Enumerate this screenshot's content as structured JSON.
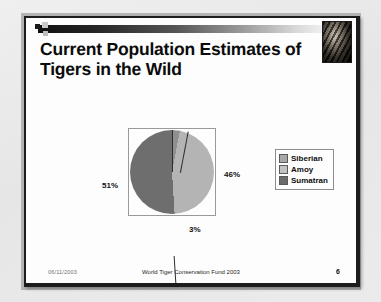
{
  "slide": {
    "title": "Current Population Estimates of Tigers in the Wild",
    "header_icon": "tiger-photo",
    "footer": {
      "date": "06/11/2003",
      "center": "World Tiger Conservation Fund 2003",
      "page_number": "6"
    }
  },
  "chart_data": {
    "type": "pie",
    "title": "",
    "categories": [
      "Siberian",
      "Amoy",
      "Sumatran"
    ],
    "values": [
      3,
      46,
      51
    ],
    "value_labels": [
      "3%",
      "46%",
      "51%"
    ],
    "colors": [
      "#8f8f8f",
      "#b4b4b4",
      "#6e6e6e"
    ],
    "legend_position": "right",
    "grid": false,
    "labels": {
      "left": "51%",
      "right": "46%",
      "bottom": "3%"
    }
  },
  "legend": {
    "items": [
      {
        "label": "Siberian",
        "color": "#a8a8a8"
      },
      {
        "label": "Amoy",
        "color": "#c2c2c2"
      },
      {
        "label": "Sumatran",
        "color": "#6b6b6b"
      }
    ]
  },
  "colors": {
    "slide_background": "#fdfdfd",
    "frame": "#1c1c1c",
    "page_background": "#e8e8e8",
    "title_text": "#0b0b0b"
  }
}
